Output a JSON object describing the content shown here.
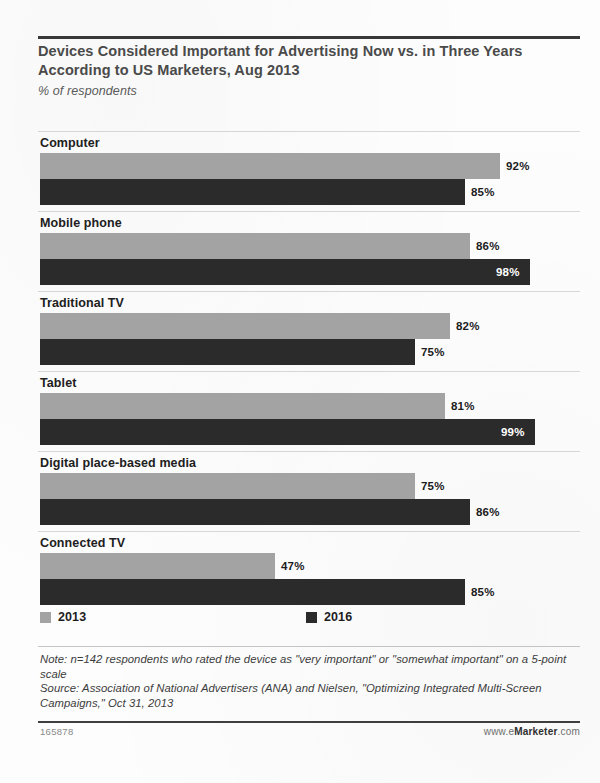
{
  "chart_data": {
    "type": "bar",
    "orientation": "horizontal",
    "title": "Devices Considered Important for Advertising Now vs. in Three Years According to US Marketers, Aug 2013",
    "subtitle": "% of respondents",
    "categories": [
      "Computer",
      "Mobile phone",
      "Traditional TV",
      "Tablet",
      "Digital place-based media",
      "Connected TV"
    ],
    "series": [
      {
        "name": "2013",
        "color": "#a3a3a3",
        "values": [
          92,
          86,
          82,
          81,
          75,
          47
        ]
      },
      {
        "name": "2016",
        "color": "#2b2b2b",
        "values": [
          85,
          98,
          75,
          99,
          86,
          85
        ]
      }
    ],
    "value_labels": [
      {
        "category": "Computer",
        "s2013": "92%",
        "s2016": "85%",
        "s2013_pos": "outside",
        "s2016_pos": "outside"
      },
      {
        "category": "Mobile phone",
        "s2013": "86%",
        "s2016": "98%",
        "s2013_pos": "outside",
        "s2016_pos": "inside"
      },
      {
        "category": "Traditional TV",
        "s2013": "82%",
        "s2016": "75%",
        "s2013_pos": "outside",
        "s2016_pos": "outside"
      },
      {
        "category": "Tablet",
        "s2013": "81%",
        "s2016": "99%",
        "s2013_pos": "outside",
        "s2016_pos": "inside"
      },
      {
        "category": "Digital place-based media",
        "s2013": "75%",
        "s2016": "86%",
        "s2013_pos": "outside",
        "s2016_pos": "outside"
      },
      {
        "category": "Connected TV",
        "s2013": "47%",
        "s2016": "85%",
        "s2013_pos": "outside",
        "s2016_pos": "outside"
      }
    ],
    "xlabel": "",
    "ylabel": "",
    "xlim": [
      0,
      100
    ],
    "grid": false,
    "legend_position": "bottom"
  },
  "legend": {
    "items": [
      {
        "label": "2013",
        "color": "#a3a3a3"
      },
      {
        "label": "2016",
        "color": "#2b2b2b"
      }
    ]
  },
  "notes": {
    "note": "Note: n=142 respondents who rated the device as \"very important\" or \"somewhat important\" on a 5-point scale",
    "source": "Source: Association of National Advertisers (ANA) and Nielsen, \"Optimizing Integrated Multi-Screen Campaigns,\" Oct 31, 2013"
  },
  "footer": {
    "chart_id": "165878",
    "brand_prefix": "www.e",
    "brand_name": "Marketer",
    "brand_suffix": ".com"
  }
}
